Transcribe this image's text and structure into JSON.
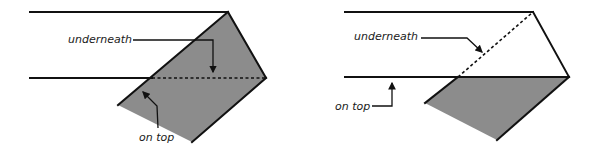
{
  "figure": {
    "colors": {
      "shade": "#8c8c8c",
      "stroke": "#111111",
      "background": "#ffffff"
    },
    "panels": [
      {
        "id": "left",
        "labels": {
          "underneath": "underneath",
          "on_top": "on top"
        }
      },
      {
        "id": "right",
        "labels": {
          "underneath": "underneath",
          "on_top": "on top"
        }
      }
    ]
  }
}
